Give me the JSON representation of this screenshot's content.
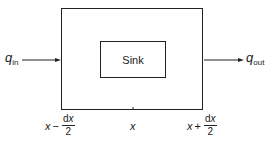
{
  "diagram": {
    "sink_label": "Sink",
    "inflow": {
      "symbol": "q",
      "subscript": "in"
    },
    "outflow": {
      "symbol": "q",
      "subscript": "out"
    },
    "positions": {
      "left": {
        "var": "x",
        "op": "−",
        "num_d": "d",
        "num_var": "x",
        "den": "2"
      },
      "center": {
        "var": "x"
      },
      "right": {
        "var": "x",
        "op": "+",
        "num_d": "d",
        "num_var": "x",
        "den": "2"
      }
    },
    "colors": {
      "stroke": "#222222",
      "background": "#ffffff"
    }
  }
}
